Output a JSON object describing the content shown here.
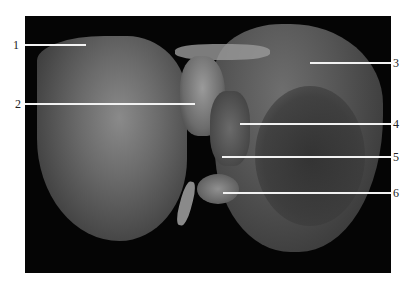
{
  "figure": {
    "labels": [
      {
        "num": "1"
      },
      {
        "num": "2"
      },
      {
        "num": "3"
      },
      {
        "num": "4"
      },
      {
        "num": "5"
      },
      {
        "num": "6"
      }
    ]
  }
}
